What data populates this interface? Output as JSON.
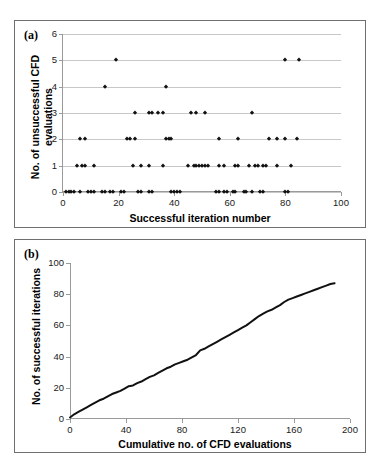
{
  "figure": {
    "panels": [
      {
        "tag": "(a)",
        "x_title": "Successful iteration number",
        "y_title": "No. of unsuccessful CFD evaluations"
      },
      {
        "tag": "(b)",
        "x_title": "Cumulative no. of CFD evaluations",
        "y_title": "No. of successful iterations"
      }
    ]
  },
  "chart_data": [
    {
      "type": "scatter",
      "title": "(a)",
      "xlabel": "Successful iteration number",
      "ylabel": "No. of unsuccessful CFD evaluations",
      "xlim": [
        0,
        100
      ],
      "ylim": [
        0,
        6
      ],
      "xticks": [
        0,
        20,
        40,
        60,
        80,
        100
      ],
      "yticks": [
        0,
        1,
        2,
        3,
        4,
        5,
        6
      ],
      "grid": true,
      "legend": "none",
      "marker": "diamond",
      "marker_color": "#111111",
      "points": [
        [
          1,
          0
        ],
        [
          2,
          0
        ],
        [
          3,
          0
        ],
        [
          4,
          0
        ],
        [
          6,
          0
        ],
        [
          9,
          0
        ],
        [
          10,
          0
        ],
        [
          11,
          0
        ],
        [
          14,
          0
        ],
        [
          15,
          0
        ],
        [
          17,
          0
        ],
        [
          18,
          0
        ],
        [
          21,
          0
        ],
        [
          22,
          0
        ],
        [
          27,
          0
        ],
        [
          28,
          0
        ],
        [
          31,
          0
        ],
        [
          32,
          0
        ],
        [
          39,
          0
        ],
        [
          40,
          0
        ],
        [
          41,
          0
        ],
        [
          42,
          0
        ],
        [
          55,
          0
        ],
        [
          56,
          0
        ],
        [
          58,
          0
        ],
        [
          59,
          0
        ],
        [
          61,
          0
        ],
        [
          62,
          0
        ],
        [
          65,
          0
        ],
        [
          66,
          0
        ],
        [
          68,
          0
        ],
        [
          71,
          0
        ],
        [
          72,
          0
        ],
        [
          80,
          0
        ],
        [
          81,
          0
        ],
        [
          5,
          1
        ],
        [
          7,
          1
        ],
        [
          8,
          1
        ],
        [
          11,
          1
        ],
        [
          25,
          1
        ],
        [
          28,
          1
        ],
        [
          31,
          1
        ],
        [
          36,
          1
        ],
        [
          45,
          1
        ],
        [
          47,
          1
        ],
        [
          48,
          1
        ],
        [
          49,
          1
        ],
        [
          50,
          1
        ],
        [
          51,
          1
        ],
        [
          52,
          1
        ],
        [
          56,
          1
        ],
        [
          58,
          1
        ],
        [
          62,
          1
        ],
        [
          63,
          1
        ],
        [
          67,
          1
        ],
        [
          69,
          1
        ],
        [
          70,
          1
        ],
        [
          72,
          1
        ],
        [
          73,
          1
        ],
        [
          77,
          1
        ],
        [
          82,
          1
        ],
        [
          6,
          2
        ],
        [
          8,
          2
        ],
        [
          23,
          2
        ],
        [
          24,
          2
        ],
        [
          26,
          2
        ],
        [
          37,
          2
        ],
        [
          38,
          2
        ],
        [
          39,
          2
        ],
        [
          56,
          2
        ],
        [
          63,
          2
        ],
        [
          74,
          2
        ],
        [
          77,
          2
        ],
        [
          80,
          2
        ],
        [
          84,
          2
        ],
        [
          26,
          3
        ],
        [
          31,
          3
        ],
        [
          32,
          3
        ],
        [
          34,
          3
        ],
        [
          36,
          3
        ],
        [
          46,
          3
        ],
        [
          48,
          3
        ],
        [
          51,
          3
        ],
        [
          68,
          3
        ],
        [
          15,
          4
        ],
        [
          37,
          4
        ],
        [
          19,
          5
        ],
        [
          80,
          5
        ],
        [
          85,
          5
        ]
      ]
    },
    {
      "type": "line",
      "title": "(b)",
      "xlabel": "Cumulative no. of CFD evaluations",
      "ylabel": "No. of successful iterations",
      "xlim": [
        0,
        200
      ],
      "ylim": [
        0,
        100
      ],
      "xticks": [
        0,
        40,
        80,
        120,
        160,
        200
      ],
      "yticks": [
        0,
        20,
        40,
        60,
        80,
        100
      ],
      "grid": false,
      "legend": "none",
      "line_color": "#111111",
      "line_width": 2,
      "x": [
        0,
        3,
        6,
        9,
        12,
        15,
        18,
        21,
        24,
        27,
        30,
        33,
        36,
        39,
        42,
        45,
        48,
        51,
        54,
        57,
        60,
        63,
        66,
        69,
        72,
        75,
        78,
        81,
        84,
        87,
        90,
        93,
        96,
        99,
        102,
        105,
        108,
        111,
        114,
        117,
        120,
        123,
        126,
        129,
        132,
        135,
        138,
        141,
        144,
        147,
        150,
        153,
        156,
        159,
        162,
        165,
        168,
        171,
        174,
        177,
        180,
        183,
        186,
        189
      ],
      "y": [
        1,
        3,
        4.5,
        6,
        7.5,
        9,
        10.5,
        12,
        13,
        14.5,
        16,
        17,
        18,
        19.5,
        21,
        21.5,
        23,
        24,
        25.5,
        27,
        28,
        29.5,
        31,
        32.5,
        33.5,
        35,
        36,
        37,
        38,
        39.5,
        41,
        44,
        45,
        46.5,
        48,
        49.5,
        51,
        52.5,
        54,
        55.5,
        57,
        58.5,
        60,
        62,
        64,
        66,
        67.5,
        69,
        70,
        71.5,
        73,
        75,
        76.5,
        77.5,
        78.5,
        79.5,
        80.5,
        81.5,
        82.5,
        83.5,
        84.5,
        85.5,
        86.5,
        87
      ]
    }
  ]
}
